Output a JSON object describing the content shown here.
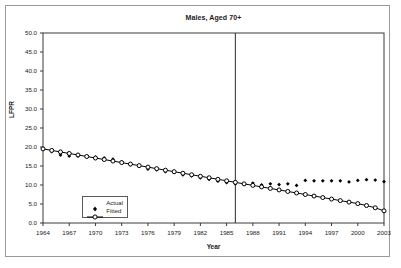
{
  "figure": {
    "background": "#ffffff",
    "frame_color": "#9a9a9a",
    "axis_color": "#3a3a3a"
  },
  "chart_data": {
    "type": "line",
    "title": "Males, Aged 70+",
    "xlabel": "Year",
    "ylabel": "LFPR",
    "xlim": [
      1964,
      2003
    ],
    "ylim": [
      0.0,
      50.0
    ],
    "grid": false,
    "legend_position": "inside-bottom-left",
    "ytick_labels": [
      "0.0",
      "5.0",
      "10.0",
      "15.0",
      "20.0",
      "25.0",
      "30.0",
      "35.0",
      "40.0",
      "45.0",
      "50.0"
    ],
    "ytick_values": [
      0,
      5,
      10,
      15,
      20,
      25,
      30,
      35,
      40,
      45,
      50
    ],
    "xtick_labels": [
      "1964",
      "1967",
      "1970",
      "1973",
      "1976",
      "1979",
      "1982",
      "1985",
      "1988",
      "1991",
      "1994",
      "1997",
      "2000",
      "2003"
    ],
    "xtick_values": [
      1964,
      1967,
      1970,
      1973,
      1976,
      1979,
      1982,
      1985,
      1988,
      1991,
      1994,
      1997,
      2000,
      2003
    ],
    "annotations": [
      {
        "type": "vertical-line",
        "x": 1986,
        "label": "sample-split-line"
      }
    ],
    "x": [
      1964,
      1965,
      1966,
      1967,
      1968,
      1969,
      1970,
      1971,
      1972,
      1973,
      1974,
      1975,
      1976,
      1977,
      1978,
      1979,
      1980,
      1981,
      1982,
      1983,
      1984,
      1985,
      1986,
      1987,
      1988,
      1989,
      1990,
      1991,
      1992,
      1993,
      1994,
      1995,
      1996,
      1997,
      1998,
      1999,
      2000,
      2001,
      2002,
      2003
    ],
    "series": [
      {
        "name": "Actual",
        "marker": "filled-diamond",
        "line": false,
        "color": "#000000",
        "values": [
          19.5,
          18.8,
          17.9,
          17.6,
          17.6,
          17.5,
          17.3,
          17.1,
          16.8,
          16.1,
          15.4,
          14.9,
          14.2,
          14.0,
          13.5,
          13.3,
          12.7,
          12.4,
          11.9,
          11.5,
          11.0,
          10.6,
          10.3,
          10.3,
          10.5,
          10.0,
          10.3,
          10.1,
          10.3,
          9.9,
          11.2,
          11.1,
          11.1,
          11.1,
          11.1,
          10.8,
          11.2,
          11.4,
          11.3,
          10.9
        ]
      },
      {
        "name": "Fitted",
        "marker": "open-circle",
        "line": true,
        "color": "#000000",
        "values": [
          19.5,
          19.1,
          18.7,
          18.3,
          17.9,
          17.5,
          17.1,
          16.7,
          16.3,
          15.9,
          15.5,
          15.1,
          14.7,
          14.3,
          13.9,
          13.5,
          13.1,
          12.7,
          12.3,
          11.9,
          11.5,
          11.1,
          10.7,
          10.3,
          9.9,
          9.5,
          9.1,
          8.7,
          8.3,
          7.9,
          7.5,
          7.1,
          6.7,
          6.3,
          5.9,
          5.5,
          5.1,
          4.6,
          4.0,
          3.2
        ]
      }
    ]
  },
  "legend": {
    "items": [
      {
        "label": "Actual",
        "key": "filled-diamond"
      },
      {
        "label": "Fitted",
        "key": "line-open-circle"
      }
    ]
  }
}
